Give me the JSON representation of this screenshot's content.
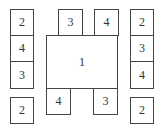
{
  "diagram": {
    "center": {
      "label": "1",
      "x": 46,
      "y": 35,
      "w": 72,
      "h": 54
    },
    "boxes": [
      {
        "id": "left-1",
        "label": "2",
        "x": 10,
        "y": 9,
        "w": 24,
        "h": 27
      },
      {
        "id": "left-2",
        "label": "4",
        "x": 10,
        "y": 36,
        "w": 24,
        "h": 26
      },
      {
        "id": "left-3",
        "label": "3",
        "x": 10,
        "y": 62,
        "w": 24,
        "h": 27
      },
      {
        "id": "left-4",
        "label": "2",
        "x": 10,
        "y": 97,
        "w": 24,
        "h": 27
      },
      {
        "id": "top-1",
        "label": "3",
        "x": 58,
        "y": 9,
        "w": 25,
        "h": 27
      },
      {
        "id": "top-2",
        "label": "4",
        "x": 94,
        "y": 9,
        "w": 25,
        "h": 27
      },
      {
        "id": "right-1",
        "label": "2",
        "x": 130,
        "y": 9,
        "w": 24,
        "h": 27
      },
      {
        "id": "right-2",
        "label": "3",
        "x": 130,
        "y": 36,
        "w": 24,
        "h": 26
      },
      {
        "id": "right-3",
        "label": "4",
        "x": 130,
        "y": 62,
        "w": 24,
        "h": 27
      },
      {
        "id": "right-4",
        "label": "2",
        "x": 130,
        "y": 97,
        "w": 24,
        "h": 27
      },
      {
        "id": "bottom-1",
        "label": "4",
        "x": 46,
        "y": 88,
        "w": 25,
        "h": 27
      },
      {
        "id": "bottom-2",
        "label": "3",
        "x": 94,
        "y": 88,
        "w": 25,
        "h": 27
      }
    ]
  }
}
